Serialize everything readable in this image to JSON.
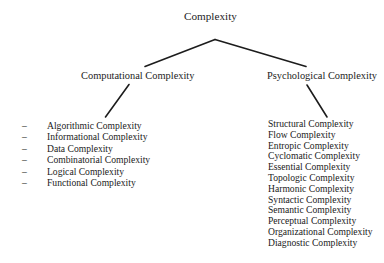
{
  "diagram": {
    "type": "tree",
    "title": "Complexity",
    "background_color": "#ffffff",
    "line_color": "#1c1c1c",
    "text_color": "#1c1c1c",
    "root": {
      "label": "Complexity"
    },
    "branches": [
      {
        "id": "computational",
        "label": "Computational Complexity",
        "bullet": "–",
        "leaves": [
          "Algorithmic Complexity",
          "Informational Complexity",
          "Data Complexity",
          "Combinatorial Complexity",
          "Logical Complexity",
          "Functional Complexity"
        ]
      },
      {
        "id": "psychological",
        "label": "Psychological Complexity",
        "bullet": "",
        "leaves": [
          "Structural Complexity",
          "Flow Complexity",
          "Entropic Complexity",
          "Cyclomatic Complexity",
          "Essential Complexity",
          "Topologic Complexity",
          "Harmonic Complexity",
          "Syntactic Complexity",
          "Semantic Complexity",
          "Perceptual Complexity",
          "Organizational Complexity",
          "Diagnostic Complexity"
        ]
      }
    ]
  }
}
